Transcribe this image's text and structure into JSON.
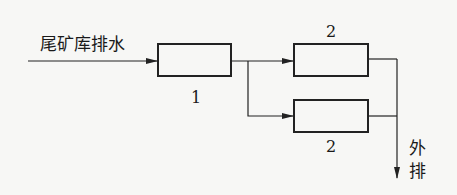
{
  "diagram": {
    "type": "process-flow",
    "input_label": "尾矿库排水",
    "nodes": [
      {
        "id": "unit1",
        "label": "1"
      },
      {
        "id": "unit2a",
        "label": "2"
      },
      {
        "id": "unit2b",
        "label": "2"
      }
    ],
    "edges": [
      {
        "from": "input",
        "to": "unit1"
      },
      {
        "from": "unit1",
        "to": "unit2a"
      },
      {
        "from": "unit1",
        "to": "unit2b"
      },
      {
        "from": "unit2a",
        "to": "output"
      },
      {
        "from": "unit2b",
        "to": "output"
      }
    ],
    "output_label_chars": [
      "外",
      "排"
    ]
  }
}
